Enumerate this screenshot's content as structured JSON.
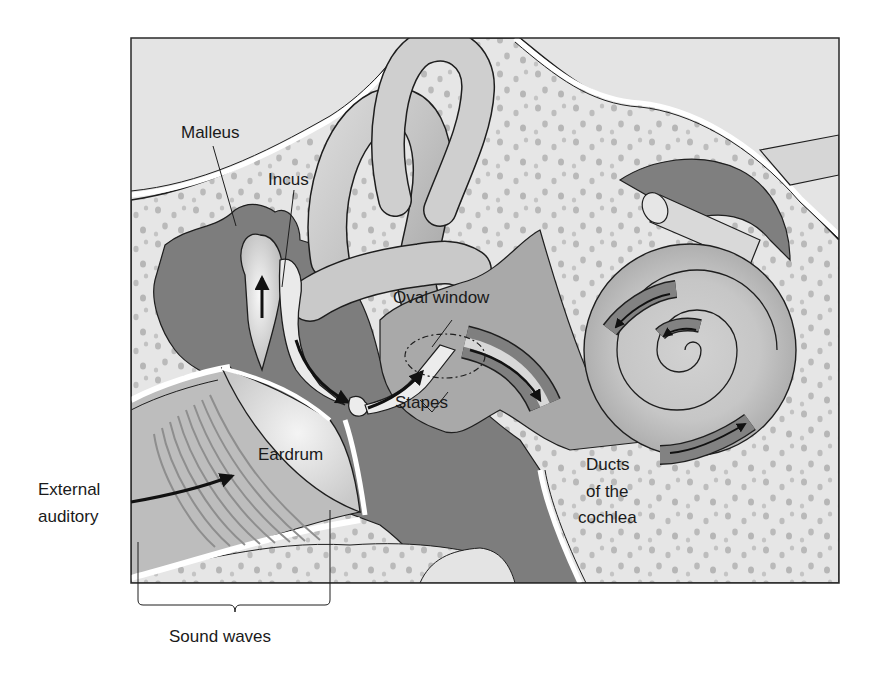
{
  "diagram": {
    "labels": {
      "malleus": "Malleus",
      "incus": "Incus",
      "oval_window": "Oval window",
      "stapes": "Stapes",
      "eardrum": "Eardrum",
      "external_line1": "External",
      "external_line2": "auditory",
      "ducts_line1": "Ducts",
      "ducts_line2": "of the",
      "ducts_line3": "cochlea",
      "sound_waves": "Sound waves"
    },
    "colors": {
      "background": "#ffffff",
      "tissue_light": "#e4e4e4",
      "bone_speckle": "#b8b8b8",
      "dark_tissue": "#7d7d7d",
      "canal_gray": "#bdbdbd",
      "highlight": "#f2f2f2",
      "outline": "#1e1e1e"
    }
  }
}
